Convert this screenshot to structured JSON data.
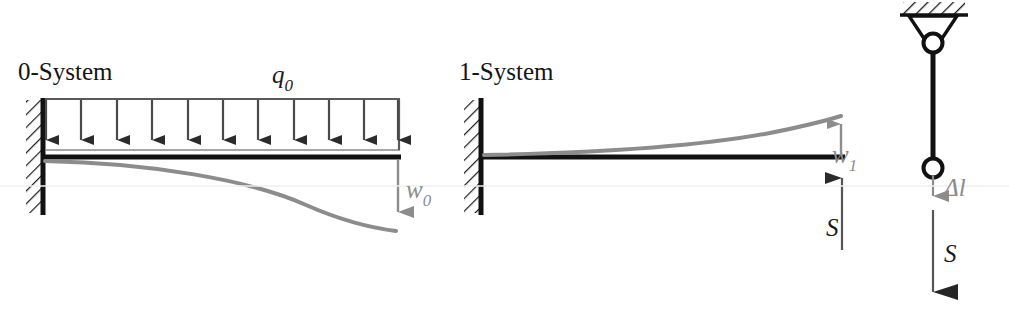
{
  "figure": {
    "background_color": "#ffffff",
    "beam_color": "#111111",
    "deflection_color": "#8c8c8c",
    "load_color": "#4a4a4a",
    "hatch_color": "#1a1a1a"
  },
  "panels": {
    "zero_system": {
      "label": "0-System",
      "load_label": "q",
      "load_sub": "0",
      "deflection_label": "w",
      "deflection_sub": "0",
      "load_arrow_count": 11
    },
    "one_system": {
      "label": "1-System",
      "deflection_label": "w",
      "deflection_sub": "1",
      "force_label": "S"
    },
    "rod": {
      "elongation_label": "l",
      "elongation_prefix": "Δ",
      "force_label": "S"
    }
  }
}
